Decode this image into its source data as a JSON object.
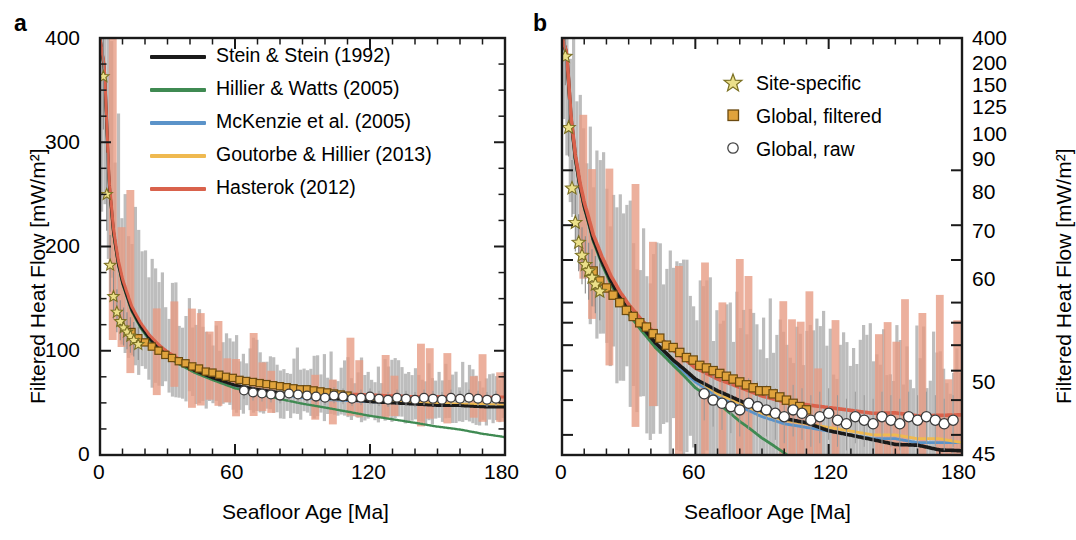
{
  "figure": {
    "panels": [
      {
        "label": "a",
        "xlabel": "Seafloor Age [Ma]",
        "ylabel": "Filtered Heat Flow [mW/m²]",
        "yscale": "linear",
        "xlim": [
          0,
          180
        ],
        "ylim": [
          0,
          400
        ],
        "xticks": [
          0,
          60,
          120,
          180
        ],
        "xminor_step": 10,
        "yticks": [
          0,
          100,
          200,
          300,
          400
        ],
        "yminor_step": 25,
        "ylabel_side": "left"
      },
      {
        "label": "b",
        "xlabel": "Seafloor Age [Ma]",
        "ylabel": "Filtered Heat Flow [mW/m²]",
        "yscale": "log",
        "xlim": [
          0,
          180
        ],
        "ylim": [
          45,
          400
        ],
        "xticks": [
          0,
          60,
          120,
          180
        ],
        "xminor_step": 10,
        "yticks": [
          400,
          200,
          150,
          125,
          100,
          90,
          80,
          70,
          60,
          50,
          45
        ],
        "ylabel_side": "right"
      }
    ],
    "legend_models": {
      "title": "",
      "entries": [
        {
          "label": "Stein & Stein (1992)",
          "color": "#1a1a1a",
          "key": "stein"
        },
        {
          "label": "Hillier & Watts (2005)",
          "color": "#3f8a52",
          "key": "hillier"
        },
        {
          "label": "McKenzie et al. (2005)",
          "color": "#5b93c9",
          "key": "mckenzie"
        },
        {
          "label": "Goutorbe & Hillier (2013)",
          "color": "#efb950",
          "key": "goutorbe"
        },
        {
          "label": "Hasterok (2012)",
          "color": "#d9624c",
          "key": "hasterok"
        }
      ]
    },
    "legend_data": {
      "entries": [
        {
          "label": "Site-specific",
          "marker": "star",
          "fill": "#ece08a",
          "stroke": "#7a6f22"
        },
        {
          "label": "Global, filtered",
          "marker": "square",
          "fill": "#e0a33c",
          "stroke": "#6b4a10"
        },
        {
          "label": "Global, raw",
          "marker": "circle",
          "fill": "#ffffff",
          "stroke": "#444444"
        }
      ]
    }
  },
  "chart_data": {
    "type": "line",
    "title": "",
    "xlabel": "Seafloor Age [Ma]",
    "ylabel": "Filtered Heat Flow [mW/m²]",
    "x": [
      0,
      2,
      4,
      6,
      8,
      10,
      14,
      18,
      22,
      26,
      30,
      36,
      42,
      50,
      60,
      70,
      80,
      90,
      100,
      110,
      120,
      130,
      140,
      150,
      160,
      170,
      180
    ],
    "series": [
      {
        "name": "Stein & Stein (1992)",
        "color": "#1a1a1a",
        "values": [
          400,
          370,
          262,
          214,
          185,
          166,
          140,
          124,
          112,
          103,
          96,
          88,
          81,
          74,
          67,
          63,
          60,
          57,
          55,
          54,
          52,
          51,
          50,
          49,
          49,
          48,
          48
        ]
      },
      {
        "name": "Hillier & Watts (2005)",
        "color": "#3f8a52",
        "values": [
          400,
          366,
          259,
          211,
          183,
          164,
          138,
          122,
          110,
          101,
          94,
          86,
          79,
          72,
          64,
          59,
          55,
          52,
          50,
          48,
          46,
          45,
          44,
          43,
          43,
          42,
          42
        ]
      },
      {
        "name": "McKenzie et al. (2005)",
        "color": "#5b93c9",
        "values": [
          400,
          368,
          261,
          213,
          184,
          165,
          139,
          123,
          111,
          102,
          95,
          87,
          80,
          73,
          66,
          61,
          58,
          55,
          53,
          52,
          51,
          50,
          49,
          49,
          48,
          48,
          48
        ]
      },
      {
        "name": "Goutorbe & Hillier (2013)",
        "color": "#efb950",
        "values": [
          400,
          369,
          261,
          213,
          185,
          166,
          140,
          124,
          112,
          103,
          96,
          88,
          81,
          74,
          67,
          62,
          59,
          56,
          54,
          53,
          52,
          51,
          50,
          50,
          49,
          49,
          48
        ]
      },
      {
        "name": "Hasterok (2012)",
        "color": "#d9624c",
        "values": [
          400,
          372,
          265,
          217,
          188,
          169,
          143,
          127,
          115,
          106,
          99,
          91,
          85,
          78,
          71,
          67,
          64,
          61,
          59,
          58,
          57,
          56,
          55,
          55,
          54,
          54,
          54
        ]
      }
    ],
    "markers": {
      "site_specific": {
        "name": "Site-specific",
        "marker": "star",
        "x": [
          1.5,
          3,
          4.5,
          6,
          7.5,
          9,
          10.5,
          12,
          13.5,
          15,
          17
        ],
        "y": [
          363,
          250,
          182,
          152,
          137,
          128,
          122,
          118,
          114,
          110,
          106
        ]
      },
      "global_filtered": {
        "name": "Global, filtered",
        "marker": "square",
        "x": [
          14,
          17,
          20,
          23,
          26,
          29,
          32,
          35,
          38,
          41,
          44,
          47,
          50,
          53,
          56,
          59,
          62,
          65,
          68,
          71,
          74,
          77,
          80,
          83,
          86,
          89,
          92,
          95,
          98,
          101,
          104,
          107,
          110
        ],
        "y": [
          118,
          112,
          108,
          104,
          100,
          96,
          93,
          90,
          88,
          85,
          83,
          80,
          79,
          77,
          75,
          74,
          72,
          71,
          70,
          69,
          68,
          67,
          66,
          65,
          64,
          63,
          63,
          62,
          61,
          60,
          59,
          58,
          57
        ]
      },
      "global_raw": {
        "name": "Global, raw",
        "marker": "circle",
        "x": [
          64,
          68,
          72,
          76,
          80,
          84,
          88,
          92,
          96,
          100,
          104,
          108,
          112,
          116,
          120,
          124,
          128,
          132,
          136,
          140,
          144,
          148,
          152,
          156,
          160,
          164,
          168,
          172,
          176
        ],
        "y": [
          62,
          60,
          59,
          58,
          57,
          59,
          58,
          57,
          56,
          55,
          57,
          56,
          54,
          55,
          56,
          54,
          53,
          55,
          54,
          53,
          55,
          54,
          53,
          55,
          54,
          55,
          54,
          53,
          54
        ]
      }
    },
    "uncertainty_bands": [
      {
        "name": "gray-percentile-band",
        "color": "#b3b3b3",
        "opacity": 0.85
      },
      {
        "name": "salmon-percentile-band",
        "color": "#e8a18c",
        "opacity": 0.8
      }
    ],
    "grid": false,
    "legend_position": "upper-right"
  }
}
